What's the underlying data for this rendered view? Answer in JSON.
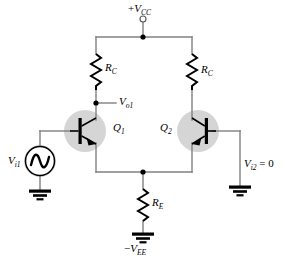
{
  "figure": {
    "kind": "circuit-schematic",
    "name": "BJT differential amplifier",
    "background_color": "#ffffff",
    "wire_color": "#808080",
    "component_color": "#000000",
    "highlight_color": "#d5d5d5"
  },
  "labels": {
    "supply_positive": "+V",
    "supply_positive_sub": "CC",
    "supply_negative_sign": "−",
    "supply_negative": "V",
    "supply_negative_sub": "EE",
    "resistor_collector_left": "R",
    "resistor_collector_left_sub": "C",
    "resistor_collector_right": "R",
    "resistor_collector_right_sub": "C",
    "resistor_emitter": "R",
    "resistor_emitter_sub": "E",
    "output_left": "V",
    "output_left_sub": "o1",
    "transistor_left": "Q",
    "transistor_left_sub": "1",
    "transistor_right": "Q",
    "transistor_right_sub": "2",
    "source_left": "V",
    "source_left_sub": "i1",
    "input_right": "V",
    "input_right_sub": "i2",
    "input_right_value": " = 0"
  },
  "components": [
    {
      "id": "vcc-terminal",
      "type": "open-terminal",
      "label": "+V_CC"
    },
    {
      "id": "rc-left",
      "type": "resistor",
      "label": "R_C"
    },
    {
      "id": "rc-right",
      "type": "resistor",
      "label": "R_C"
    },
    {
      "id": "re",
      "type": "resistor",
      "label": "R_E"
    },
    {
      "id": "q1",
      "type": "npn-transistor",
      "label": "Q_1",
      "highlighted": true
    },
    {
      "id": "q2",
      "type": "npn-transistor",
      "label": "Q_2",
      "highlighted": true,
      "mirrored": true
    },
    {
      "id": "vi1-source",
      "type": "ac-source",
      "label": "V_i1",
      "highlighted": true
    },
    {
      "id": "ground-left",
      "type": "ground"
    },
    {
      "id": "ground-right",
      "type": "ground"
    },
    {
      "id": "ground-ree",
      "type": "ground"
    },
    {
      "id": "node-vo1",
      "type": "junction-dot",
      "label": "V_o1"
    },
    {
      "id": "node-vcc-rail",
      "type": "junction-dot"
    },
    {
      "id": "node-emitter-rail",
      "type": "junction-dot"
    }
  ]
}
